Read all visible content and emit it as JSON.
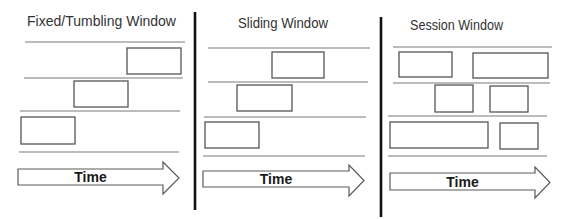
{
  "diagram": {
    "background": "#ffffff",
    "colors": {
      "text": "#333333",
      "lane_line": "#a6a6a6",
      "box_stroke": "#555555",
      "divider": "#111111",
      "arrow_stroke": "#5a5a5a"
    },
    "dividers": [
      {
        "x": 195,
        "y1": 12,
        "y2": 210
      },
      {
        "x": 381,
        "y1": 17,
        "y2": 217
      }
    ],
    "panels": [
      {
        "id": "fixed",
        "title": "Fixed/Tumbling Window",
        "title_pos": {
          "x": 27,
          "y": 26,
          "width": 149
        },
        "lane_lines": [
          {
            "x1": 25,
            "x2": 185,
            "y": 42
          },
          {
            "x1": 24,
            "x2": 183,
            "y": 78
          },
          {
            "x1": 20,
            "x2": 180,
            "y": 111
          },
          {
            "x1": 19,
            "x2": 179,
            "y": 152
          }
        ],
        "windows": [
          {
            "x": 127,
            "y": 48,
            "w": 54,
            "h": 26
          },
          {
            "x": 74,
            "y": 81,
            "w": 54,
            "h": 26
          },
          {
            "x": 21,
            "y": 117,
            "w": 54,
            "h": 27
          }
        ],
        "arrow": {
          "label": "Time",
          "x": 18,
          "body_top": 169,
          "body_bottom": 185,
          "head_x": 163,
          "head_top": 162,
          "head_bottom": 194,
          "tip_x": 179
        }
      },
      {
        "id": "sliding",
        "title": "Sliding Window",
        "title_pos": {
          "x": 238,
          "y": 28,
          "width": 90
        },
        "lane_lines": [
          {
            "x1": 208,
            "x2": 370,
            "y": 48
          },
          {
            "x1": 208,
            "x2": 368,
            "y": 82
          },
          {
            "x1": 204,
            "x2": 366,
            "y": 117
          },
          {
            "x1": 203,
            "x2": 365,
            "y": 156
          }
        ],
        "windows": [
          {
            "x": 272,
            "y": 52,
            "w": 52,
            "h": 26
          },
          {
            "x": 237,
            "y": 85,
            "w": 55,
            "h": 26
          },
          {
            "x": 205,
            "y": 122,
            "w": 54,
            "h": 26
          }
        ],
        "arrow": {
          "label": "Time",
          "x": 203,
          "body_top": 171,
          "body_bottom": 187,
          "head_x": 349,
          "head_top": 165,
          "head_bottom": 196,
          "tip_x": 364
        }
      },
      {
        "id": "session",
        "title": "Session Window",
        "title_pos": {
          "x": 410,
          "y": 30,
          "width": 93
        },
        "lane_lines": [
          {
            "x1": 393,
            "x2": 552,
            "y": 47
          },
          {
            "x1": 393,
            "x2": 550,
            "y": 83
          },
          {
            "x1": 388,
            "x2": 547,
            "y": 116
          },
          {
            "x1": 388,
            "x2": 547,
            "y": 156
          }
        ],
        "windows": [
          {
            "x": 399,
            "y": 52,
            "w": 53,
            "h": 25
          },
          {
            "x": 473,
            "y": 53,
            "w": 75,
            "h": 25
          },
          {
            "x": 435,
            "y": 85,
            "w": 38,
            "h": 27
          },
          {
            "x": 490,
            "y": 86,
            "w": 38,
            "h": 26
          },
          {
            "x": 390,
            "y": 122,
            "w": 98,
            "h": 26
          },
          {
            "x": 500,
            "y": 123,
            "w": 38,
            "h": 26
          }
        ],
        "arrow": {
          "label": "Time",
          "x": 390,
          "body_top": 173,
          "body_bottom": 190,
          "head_x": 535,
          "head_top": 167,
          "head_bottom": 198,
          "tip_x": 550
        }
      }
    ]
  }
}
